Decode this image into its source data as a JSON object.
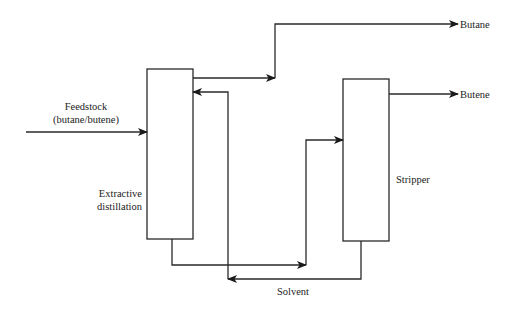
{
  "diagram": {
    "type": "process-flow",
    "units": {
      "extractive_column": {
        "label_line1": "Extractive",
        "label_line2": "distillation"
      },
      "stripper": {
        "label": "Stripper"
      }
    },
    "streams": {
      "feed": {
        "label_line1": "Feedstock",
        "label_line2": "(butane/butene)"
      },
      "butane": {
        "label": "Butane"
      },
      "butene": {
        "label": "Butene"
      },
      "solvent": {
        "label": "Solvent"
      }
    },
    "colors": {
      "line": "#2a2a2a",
      "background": "#ffffff"
    }
  }
}
